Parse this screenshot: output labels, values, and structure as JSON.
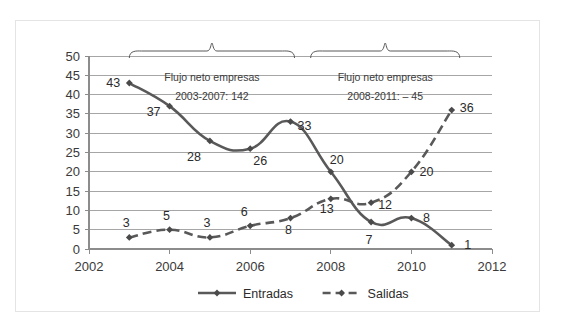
{
  "chart_data": {
    "type": "line",
    "title": "",
    "xlabel": "",
    "ylabel": "",
    "x": [
      2003,
      2004,
      2005,
      2006,
      2007,
      2008,
      2009,
      2010,
      2011
    ],
    "xlim": [
      2002,
      2012
    ],
    "ylim": [
      0,
      50
    ],
    "xticks": [
      "2002",
      "2004",
      "2006",
      "2008",
      "2010",
      "2012"
    ],
    "xtick_values": [
      2002,
      2004,
      2006,
      2008,
      2010,
      2012
    ],
    "yticks": [
      "0",
      "5",
      "10",
      "15",
      "20",
      "25",
      "30",
      "35",
      "40",
      "45",
      "50"
    ],
    "ytick_values": [
      0,
      5,
      10,
      15,
      20,
      25,
      30,
      35,
      40,
      45,
      50
    ],
    "grid": true,
    "legend_position": "bottom",
    "series": [
      {
        "name": "Entradas",
        "style": "solid",
        "marker": "diamond",
        "values": [
          43,
          37,
          28,
          26,
          33,
          20,
          7,
          8,
          1
        ],
        "label_offsets": [
          {
            "dx": -16,
            "dy": 4
          },
          {
            "dx": -16,
            "dy": 10
          },
          {
            "dx": -16,
            "dy": 20
          },
          {
            "dx": 10,
            "dy": 16
          },
          {
            "dx": 14,
            "dy": 8
          },
          {
            "dx": 6,
            "dy": -8
          },
          {
            "dx": -2,
            "dy": 22
          },
          {
            "dx": 15,
            "dy": 4
          },
          {
            "dx": 16,
            "dy": 4
          }
        ]
      },
      {
        "name": "Salidas",
        "style": "dashed",
        "marker": "diamond",
        "values": [
          3,
          5,
          3,
          6,
          8,
          13,
          12,
          20,
          36
        ],
        "label_offsets": [
          {
            "dx": -3,
            "dy": -10
          },
          {
            "dx": -3,
            "dy": -10
          },
          {
            "dx": -3,
            "dy": -10
          },
          {
            "dx": -6,
            "dy": -10
          },
          {
            "dx": -2,
            "dy": 16
          },
          {
            "dx": -4,
            "dy": 14
          },
          {
            "dx": 14,
            "dy": 6
          },
          {
            "dx": 15,
            "dy": 4
          },
          {
            "dx": 15,
            "dy": 2
          }
        ]
      }
    ],
    "annotations": [
      {
        "id": "left",
        "line1": "Flujo neto empresas",
        "line2": "2003-2007: 142",
        "bracket_from": 2003,
        "bracket_to": 2007.1
      },
      {
        "id": "right",
        "line1": "Flujo neto empresas",
        "line2": "2008-2011: – 45",
        "bracket_from": 2007.5,
        "bracket_to": 2011.2
      }
    ]
  },
  "legend": {
    "items": [
      {
        "label": "Entradas",
        "style": "solid"
      },
      {
        "label": "Salidas",
        "style": "dashed"
      }
    ]
  },
  "colors": {
    "series": "#595959",
    "marker": "#4a4a4a",
    "grid": "#a6a6a6",
    "axis": "#8c8c8c",
    "text": "#2b2b2b",
    "frame_border": "#e4e4e4",
    "background": "#ffffff"
  }
}
